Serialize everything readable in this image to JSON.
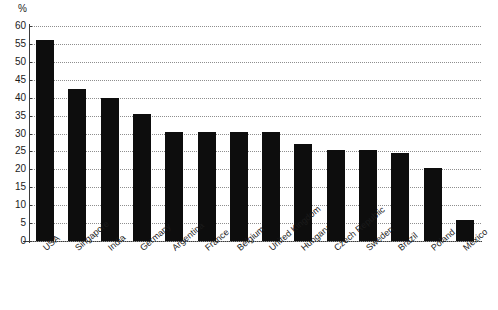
{
  "chart_data": {
    "type": "bar",
    "title": "",
    "subtitle": "",
    "xlabel": "",
    "ylabel": "%",
    "unit_label": "%",
    "ylim": [
      0,
      60
    ],
    "ytick_step": 5,
    "yticks": [
      60,
      55,
      50,
      45,
      40,
      35,
      30,
      25,
      20,
      15,
      10,
      5,
      0
    ],
    "grid": true,
    "grid_style": "dotted",
    "legend": null,
    "legend_position": "none",
    "orientation": "vertical",
    "bar_color": "#0d0d0d",
    "categories": [
      "USA",
      "Singapore",
      "India",
      "Germany",
      "Argentina",
      "France",
      "Belgium",
      "United Kingdom",
      "Hungary",
      "Czech Republic",
      "Sweden",
      "Brazil",
      "Poland",
      "Mexico"
    ],
    "values": [
      56,
      42.5,
      40,
      35.5,
      30.5,
      30.5,
      30.5,
      30.5,
      27,
      25.5,
      25.5,
      24.5,
      20.5,
      6
    ]
  }
}
